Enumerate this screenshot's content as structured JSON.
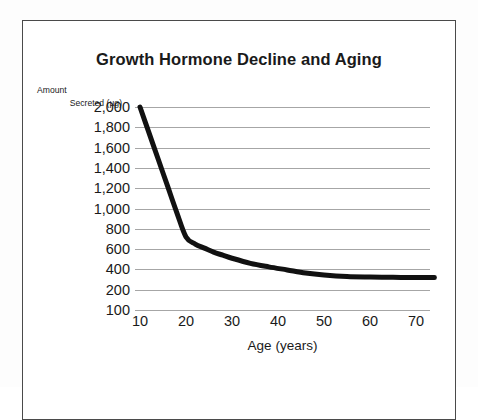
{
  "chart_data": {
    "type": "line",
    "title": "Growth Hormone Decline and Aging",
    "xlabel": "Age (years)",
    "ylabel": "Amount Secreted (µg)",
    "ylabel_line1": "Amount",
    "ylabel_line2": "Secreted (µg)",
    "xlim": [
      10,
      74
    ],
    "ylim": [
      100,
      2000
    ],
    "x_ticks": [
      10,
      20,
      30,
      40,
      50,
      60,
      70
    ],
    "x_tick_labels": [
      "10",
      "20",
      "30",
      "40",
      "50",
      "60",
      "70"
    ],
    "y_ticks": [
      2000,
      1800,
      1600,
      1400,
      1200,
      1000,
      800,
      600,
      400,
      200,
      100
    ],
    "y_tick_labels": [
      "2,000",
      "1,800",
      "1,600",
      "1,400",
      "1,200",
      "1,000",
      "800",
      "600",
      "400",
      "200",
      "100"
    ],
    "grid": "horizontal",
    "legend": "none",
    "series": [
      {
        "name": "Growth hormone secreted",
        "color": "#111111",
        "line_width": 5,
        "x": [
          10,
          12,
          14,
          16,
          18,
          20,
          22,
          24,
          26,
          28,
          30,
          34,
          38,
          42,
          46,
          50,
          55,
          60,
          65,
          70,
          74
        ],
        "values": [
          2000,
          1740,
          1480,
          1220,
          960,
          720,
          650,
          610,
          570,
          540,
          510,
          460,
          425,
          395,
          365,
          345,
          330,
          325,
          322,
          320,
          320
        ]
      }
    ],
    "colors": {
      "curve": "#111111",
      "gridline": "#a6a6a6",
      "text": "#1a1a1a",
      "frame_border": "#4a4a4a",
      "background": "#ffffff"
    }
  }
}
